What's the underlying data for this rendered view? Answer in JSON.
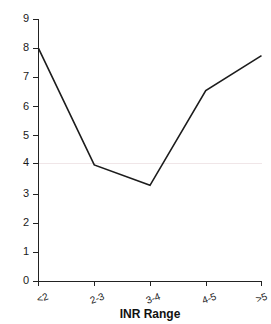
{
  "chart_data": {
    "type": "line",
    "title": "",
    "subtitle": "",
    "xlabel": "INR Range",
    "ylabel": "",
    "categories": [
      "<2",
      "2-3",
      "3-4",
      "4-5",
      ">5"
    ],
    "values": [
      8.0,
      4.0,
      3.3,
      6.55,
      7.75
    ],
    "series": [
      {
        "name": "",
        "values": [
          8.0,
          4.0,
          3.3,
          6.55,
          7.75
        ]
      }
    ],
    "ylim": [
      0,
      9
    ],
    "ytick_labels": [
      "0",
      "1",
      "2",
      "3",
      "4",
      "5",
      "6",
      "7",
      "8",
      "9"
    ],
    "ytick_values": [
      0,
      1,
      2,
      3,
      4,
      5,
      6,
      7,
      8,
      9
    ],
    "xtick_labels": [
      "<2",
      "2-3",
      "3-4",
      "4-5",
      ">5"
    ],
    "grid": "horizontal-single-at-4",
    "gridline_values": [
      4
    ],
    "legend": "none",
    "legend_position": "none",
    "line_color": "#1c1c1c",
    "axis_color": "#222222",
    "grid_color": "#f0e6e8",
    "background_color": "#ffffff",
    "markers": "none",
    "xtick_label_rotation": "-20"
  }
}
